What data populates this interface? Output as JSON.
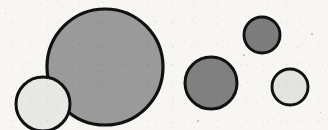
{
  "figure": {
    "type": "shape-illustration",
    "background_color": "#f7f6f3",
    "outline_color": "#111111",
    "width": 328,
    "height": 130,
    "shape_count": 5,
    "shapes": [
      {
        "name": "large-gray-circle",
        "shape": "circle",
        "cx": 105,
        "cy": 67,
        "r": 58,
        "fill": "#9a9a9a",
        "stroke": "#111111",
        "stroke_width": 3.2,
        "size_label": "large",
        "tone_label": "medium gray"
      },
      {
        "name": "light-circle-bottom-left",
        "shape": "circle",
        "cx": 43,
        "cy": 104,
        "r": 27,
        "fill": "#e8e8e5",
        "stroke": "#111111",
        "stroke_width": 3.0,
        "size_label": "small",
        "tone_label": "light gray"
      },
      {
        "name": "medium-dark-circle-center-right",
        "shape": "circle",
        "cx": 211,
        "cy": 83,
        "r": 26,
        "fill": "#808080",
        "stroke": "#111111",
        "stroke_width": 3.0,
        "size_label": "medium",
        "tone_label": "dark gray"
      },
      {
        "name": "small-dark-circle-top-right",
        "shape": "circle",
        "cx": 262,
        "cy": 35,
        "r": 18,
        "fill": "#7d7d7d",
        "stroke": "#111111",
        "stroke_width": 2.9,
        "size_label": "small",
        "tone_label": "dark gray"
      },
      {
        "name": "small-light-circle-bottom-right",
        "shape": "circle",
        "cx": 290,
        "cy": 87,
        "r": 18,
        "fill": "#e3e3e0",
        "stroke": "#111111",
        "stroke_width": 2.9,
        "size_label": "small",
        "tone_label": "light gray"
      }
    ],
    "specks": [
      {
        "x": 311,
        "y": 33,
        "d": 2
      },
      {
        "x": 243,
        "y": 54,
        "d": 2
      },
      {
        "x": 197,
        "y": 120,
        "d": 2
      },
      {
        "x": 5,
        "y": 13,
        "d": 1
      },
      {
        "x": 320,
        "y": 112,
        "d": 1
      }
    ]
  }
}
